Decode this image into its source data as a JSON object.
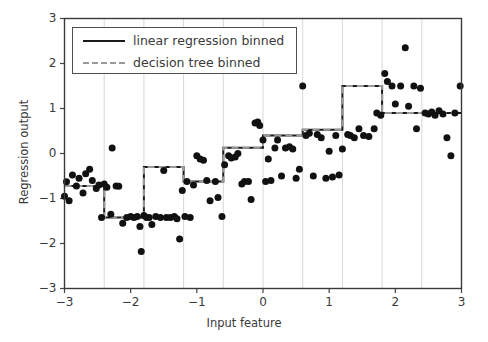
{
  "chart_data": {
    "type": "scatter",
    "title": "",
    "xlabel": "Input feature",
    "ylabel": "Regression output",
    "xlim": [
      -3,
      3
    ],
    "ylim": [
      -3,
      3
    ],
    "xticks": [
      -3,
      -2,
      -1,
      0,
      1,
      2,
      3
    ],
    "xtick_labels": [
      "−3",
      "−2",
      "−1",
      "0",
      "1",
      "2",
      "3"
    ],
    "yticks": [
      -3,
      -2,
      -1,
      0,
      1,
      2,
      3
    ],
    "ytick_labels": [
      "−3",
      "−2",
      "−1",
      "0",
      "1",
      "2",
      "3"
    ],
    "grid": "vertical-only",
    "grid_color": "#d8d8d8",
    "legend_position": "upper left",
    "bin_edges": [
      -3.0,
      -2.4,
      -1.8,
      -1.2,
      -0.6,
      0.0,
      0.6,
      1.2,
      1.8,
      2.4,
      3.0
    ],
    "series": [
      {
        "name": "linear regression binned",
        "type": "step",
        "style": "solid",
        "color": "#1a1a1a",
        "linewidth": 2,
        "bin_values": [
          -0.72,
          -1.42,
          -0.3,
          -0.62,
          0.13,
          0.4,
          0.53,
          1.5,
          0.9,
          0.9
        ]
      },
      {
        "name": "decision tree binned",
        "type": "step",
        "style": "dashed",
        "color": "#9a9a9a",
        "linewidth": 2,
        "bin_values": [
          -0.72,
          -1.42,
          -0.3,
          -0.62,
          0.13,
          0.4,
          0.53,
          1.5,
          0.9,
          0.9
        ]
      },
      {
        "name": "samples",
        "type": "scatter",
        "color": "#111111",
        "marker": "o",
        "marker_size": 7,
        "points": [
          [
            -3.0,
            -0.95
          ],
          [
            -2.97,
            -0.63
          ],
          [
            -2.93,
            -1.05
          ],
          [
            -2.88,
            -0.48
          ],
          [
            -2.82,
            -0.72
          ],
          [
            -2.78,
            -0.55
          ],
          [
            -2.72,
            -0.88
          ],
          [
            -2.68,
            -0.45
          ],
          [
            -2.62,
            -0.35
          ],
          [
            -2.58,
            -0.6
          ],
          [
            -2.52,
            -0.78
          ],
          [
            -2.48,
            -0.7
          ],
          [
            -2.44,
            -1.42
          ],
          [
            -2.4,
            -0.68
          ],
          [
            -2.36,
            -0.75
          ],
          [
            -2.3,
            -1.35
          ],
          [
            -2.28,
            0.12
          ],
          [
            -2.22,
            -0.72
          ],
          [
            -2.18,
            -0.73
          ],
          [
            -2.12,
            -1.55
          ],
          [
            -2.06,
            -1.42
          ],
          [
            -2.0,
            -1.4
          ],
          [
            -1.95,
            -1.42
          ],
          [
            -1.9,
            -1.4
          ],
          [
            -1.86,
            -1.62
          ],
          [
            -1.84,
            -2.18
          ],
          [
            -1.8,
            -1.38
          ],
          [
            -1.76,
            -1.42
          ],
          [
            -1.72,
            -1.42
          ],
          [
            -1.68,
            -1.58
          ],
          [
            -1.62,
            -1.4
          ],
          [
            -1.55,
            -1.42
          ],
          [
            -1.5,
            -0.38
          ],
          [
            -1.46,
            -1.42
          ],
          [
            -1.4,
            -1.42
          ],
          [
            -1.34,
            -1.4
          ],
          [
            -1.3,
            -1.45
          ],
          [
            -1.26,
            -1.9
          ],
          [
            -1.22,
            -0.82
          ],
          [
            -1.18,
            -1.4
          ],
          [
            -1.15,
            -0.62
          ],
          [
            -1.1,
            -1.42
          ],
          [
            -1.05,
            -0.7
          ],
          [
            -1.0,
            -0.05
          ],
          [
            -0.95,
            -0.12
          ],
          [
            -0.9,
            -0.15
          ],
          [
            -0.85,
            -0.6
          ],
          [
            -0.8,
            -1.05
          ],
          [
            -0.72,
            -0.62
          ],
          [
            -0.68,
            -0.98
          ],
          [
            -0.62,
            -1.4
          ],
          [
            -0.58,
            -0.25
          ],
          [
            -0.52,
            -0.05
          ],
          [
            -0.48,
            -0.1
          ],
          [
            -0.42,
            -0.08
          ],
          [
            -0.38,
            0.0
          ],
          [
            -0.32,
            -0.68
          ],
          [
            -0.28,
            -0.62
          ],
          [
            -0.22,
            -0.62
          ],
          [
            -0.18,
            -1.02
          ],
          [
            -0.12,
            0.68
          ],
          [
            -0.08,
            0.7
          ],
          [
            -0.05,
            0.62
          ],
          [
            0.0,
            0.3
          ],
          [
            0.04,
            -0.62
          ],
          [
            0.08,
            -0.12
          ],
          [
            0.12,
            -0.6
          ],
          [
            0.18,
            0.12
          ],
          [
            0.22,
            0.3
          ],
          [
            0.28,
            -0.5
          ],
          [
            0.34,
            0.12
          ],
          [
            0.4,
            0.15
          ],
          [
            0.45,
            0.1
          ],
          [
            0.5,
            -0.55
          ],
          [
            0.55,
            -0.35
          ],
          [
            0.6,
            1.5
          ],
          [
            0.65,
            0.4
          ],
          [
            0.7,
            0.45
          ],
          [
            0.76,
            -0.5
          ],
          [
            0.82,
            0.42
          ],
          [
            0.88,
            0.35
          ],
          [
            0.95,
            -0.55
          ],
          [
            1.0,
            0.05
          ],
          [
            1.05,
            -0.52
          ],
          [
            1.1,
            0.4
          ],
          [
            1.15,
            -0.48
          ],
          [
            1.2,
            0.1
          ],
          [
            1.28,
            0.42
          ],
          [
            1.32,
            0.4
          ],
          [
            1.38,
            0.35
          ],
          [
            1.45,
            0.55
          ],
          [
            1.52,
            0.4
          ],
          [
            1.6,
            0.38
          ],
          [
            1.68,
            0.55
          ],
          [
            1.72,
            0.9
          ],
          [
            1.78,
            0.85
          ],
          [
            1.84,
            1.78
          ],
          [
            1.88,
            1.6
          ],
          [
            1.95,
            1.5
          ],
          [
            2.0,
            1.1
          ],
          [
            2.08,
            1.5
          ],
          [
            2.15,
            2.35
          ],
          [
            2.2,
            1.05
          ],
          [
            2.28,
            1.5
          ],
          [
            2.32,
            0.55
          ],
          [
            2.38,
            1.45
          ],
          [
            2.45,
            0.9
          ],
          [
            2.5,
            0.88
          ],
          [
            2.55,
            0.92
          ],
          [
            2.6,
            0.85
          ],
          [
            2.66,
            0.95
          ],
          [
            2.72,
            0.88
          ],
          [
            2.78,
            0.35
          ],
          [
            2.84,
            -0.05
          ],
          [
            2.9,
            0.9
          ],
          [
            2.98,
            1.5
          ]
        ]
      }
    ]
  },
  "legend": {
    "entries": [
      {
        "label": "linear regression binned",
        "style": "solid",
        "color": "#1a1a1a"
      },
      {
        "label": "decision tree binned",
        "style": "dashed",
        "color": "#9a9a9a"
      }
    ]
  },
  "axes": {
    "xlabel": "Input feature",
    "ylabel": "Regression output"
  }
}
